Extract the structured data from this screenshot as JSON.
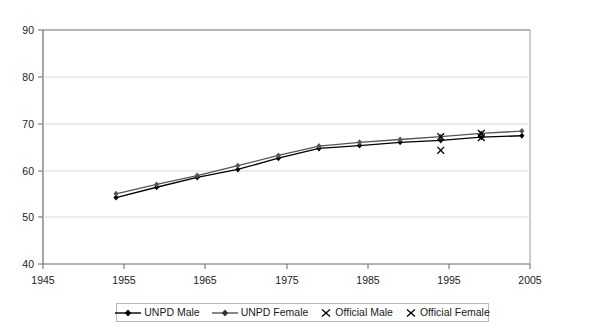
{
  "chart_data": {
    "type": "line",
    "title": "",
    "xlabel": "",
    "ylabel": "",
    "xlim": [
      1945,
      2005
    ],
    "ylim": [
      40,
      90
    ],
    "xticks": [
      1945,
      1955,
      1965,
      1975,
      1985,
      1995,
      2005
    ],
    "yticks": [
      40,
      50,
      60,
      70,
      80,
      90
    ],
    "grid": "horizontal",
    "legend_position": "bottom-center",
    "x": [
      1954,
      1959,
      1964,
      1969,
      1974,
      1979,
      1984,
      1989,
      1994,
      1999,
      2004
    ],
    "series": [
      {
        "name": "UNPD Male",
        "type": "line",
        "marker": "diamond",
        "color": "#000000",
        "values": [
          54.2,
          56.4,
          58.5,
          60.2,
          62.6,
          64.7,
          65.3,
          66.0,
          66.4,
          67.1,
          67.4
        ]
      },
      {
        "name": "UNPD Female",
        "type": "line",
        "marker": "diamond",
        "color": "#555555",
        "values": [
          55.0,
          57.0,
          58.9,
          61.0,
          63.2,
          65.2,
          66.0,
          66.6,
          67.2,
          67.9,
          68.4
        ]
      },
      {
        "name": "Official Male",
        "type": "scatter",
        "marker": "x",
        "color": "#000000",
        "points": [
          {
            "x": 1994,
            "y": 64.3
          },
          {
            "x": 1999,
            "y": 67.0
          }
        ]
      },
      {
        "name": "Official Female",
        "type": "scatter",
        "marker": "x",
        "color": "#000000",
        "points": [
          {
            "x": 1994,
            "y": 67.2
          },
          {
            "x": 1999,
            "y": 67.9
          }
        ]
      }
    ]
  },
  "axis": {
    "y_labels": [
      "90",
      "80",
      "70",
      "60",
      "50",
      "40"
    ],
    "x_labels": [
      "1945",
      "1955",
      "1965",
      "1975",
      "1985",
      "1995",
      "2005"
    ]
  },
  "legend": {
    "items": [
      {
        "label": "UNPD Male",
        "marker": "line-diamond"
      },
      {
        "label": "UNPD Female",
        "marker": "line-diamond"
      },
      {
        "label": "Official Male",
        "marker": "x"
      },
      {
        "label": "Official Female",
        "marker": "x"
      }
    ]
  }
}
